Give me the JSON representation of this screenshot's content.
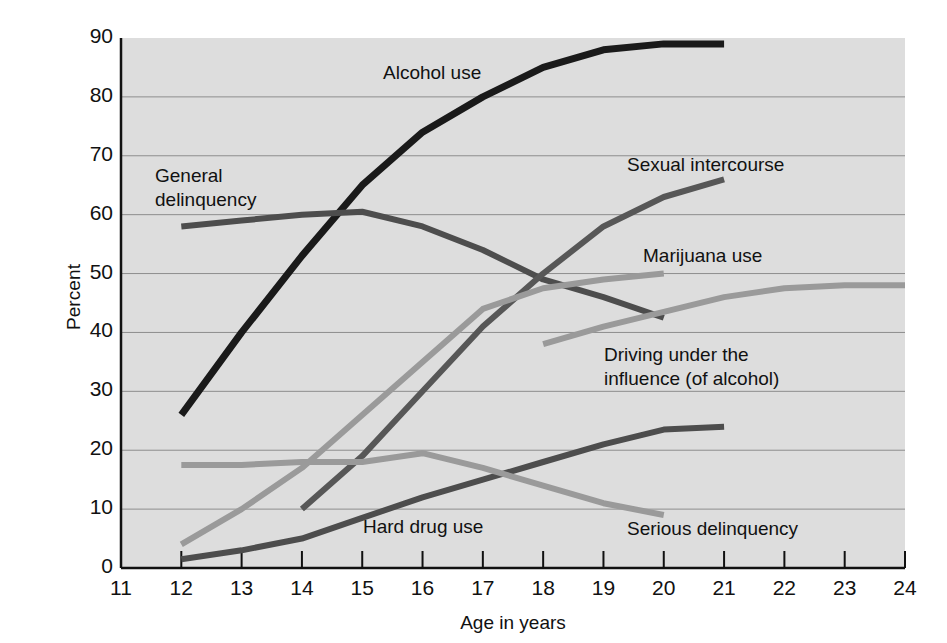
{
  "chart_data": {
    "type": "line",
    "title": "",
    "xlabel": "Age in years",
    "ylabel": "Percent",
    "xlim": [
      11,
      24
    ],
    "ylim": [
      0,
      90
    ],
    "grid": true,
    "legend_position": "inline-annotations",
    "xticks": [
      "11",
      "12",
      "13",
      "14",
      "15",
      "16",
      "17",
      "18",
      "19",
      "20",
      "21",
      "22",
      "23",
      "24"
    ],
    "yticks": [
      "0",
      "10",
      "20",
      "30",
      "40",
      "50",
      "60",
      "70",
      "80",
      "90"
    ],
    "series": [
      {
        "name": "Alcohol use",
        "color": "#1a1a1a",
        "width": 7,
        "x": [
          12,
          13,
          14,
          15,
          16,
          17,
          18,
          19,
          20,
          21
        ],
        "values": [
          26,
          40,
          53,
          65,
          74,
          80,
          85,
          88,
          89,
          89
        ]
      },
      {
        "name": "General delinquency",
        "color": "#4d4d4d",
        "width": 6,
        "x": [
          12,
          13,
          14,
          15,
          16,
          17,
          18,
          19,
          20
        ],
        "values": [
          58,
          59,
          60,
          60.5,
          58,
          54,
          49,
          46,
          42.5
        ]
      },
      {
        "name": "Sexual intercourse",
        "color": "#575757",
        "width": 6,
        "x": [
          14,
          15,
          16,
          17,
          18,
          19,
          20,
          21
        ],
        "values": [
          10,
          19,
          30,
          41,
          50,
          58,
          63,
          66
        ]
      },
      {
        "name": "Marijuana use",
        "color": "#9a9a9a",
        "width": 6,
        "x": [
          12,
          13,
          14,
          15,
          16,
          17,
          18,
          19,
          20
        ],
        "values": [
          4,
          10,
          17,
          26,
          35,
          44,
          47.5,
          49,
          50
        ]
      },
      {
        "name": "Driving under the\ninfluence (of alcohol)",
        "color": "#9a9a9a",
        "width": 6,
        "x": [
          18,
          19,
          20,
          21,
          22,
          23,
          24
        ],
        "values": [
          38,
          41,
          43.5,
          46,
          47.5,
          48,
          48
        ]
      },
      {
        "name": "Hard drug use",
        "color": "#4d4d4d",
        "width": 6,
        "x": [
          12,
          13,
          14,
          15,
          16,
          17,
          18,
          19,
          20,
          21
        ],
        "values": [
          1.5,
          3,
          5,
          8.5,
          12,
          15,
          18,
          21,
          23.5,
          24
        ]
      },
      {
        "name": "Serious delinquency",
        "color": "#9a9a9a",
        "width": 6,
        "x": [
          12,
          13,
          14,
          15,
          16,
          17,
          18,
          19,
          20
        ],
        "values": [
          17.5,
          17.5,
          18,
          18,
          19.5,
          17,
          14,
          11,
          9
        ]
      }
    ],
    "annotations": [
      {
        "text": "Alcohol use",
        "x_px": 383,
        "y_px": 62
      },
      {
        "text": "General",
        "x_px": 155,
        "y_px": 165
      },
      {
        "text": "delinquency",
        "x_px": 155,
        "y_px": 189
      },
      {
        "text": "Sexual intercourse",
        "x_px": 627,
        "y_px": 154
      },
      {
        "text": "Marijuana use",
        "x_px": 643,
        "y_px": 245
      },
      {
        "text": "Driving under the",
        "x_px": 604,
        "y_px": 344
      },
      {
        "text": "influence (of alcohol)",
        "x_px": 604,
        "y_px": 368
      },
      {
        "text": "Hard drug use",
        "x_px": 363,
        "y_px": 516
      },
      {
        "text": "Serious delinquency",
        "x_px": 627,
        "y_px": 518
      }
    ]
  }
}
